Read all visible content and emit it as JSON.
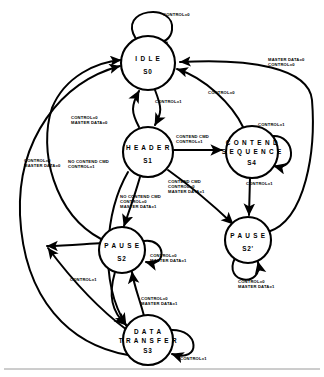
{
  "diagram": {
    "type": "state-machine",
    "title": "",
    "states": [
      {
        "id": "S0",
        "name": "IDLE",
        "label_line1": "I D L E",
        "label_line2": "S0",
        "cx": 148,
        "cy": 63,
        "r": 27
      },
      {
        "id": "S1",
        "name": "HEADER",
        "label_line1": "H E A D E R",
        "label_line2": "S1",
        "cx": 148,
        "cy": 152,
        "r": 25
      },
      {
        "id": "S4",
        "name": "CONTEND SEQUENCE",
        "label_line1": "C O N T E N D",
        "label_line2": "S4",
        "label_mid": "S E Q U E N C E",
        "cx": 252,
        "cy": 152,
        "r": 26
      },
      {
        "id": "S2",
        "name": "PAUSE",
        "label_line1": "P A U S E",
        "label_line2": "S2",
        "cx": 122,
        "cy": 250,
        "r": 23
      },
      {
        "id": "S2p",
        "name": "PAUSE PRIME",
        "label_line1": "P A U S E",
        "label_line2": "S2'",
        "cx": 248,
        "cy": 240,
        "r": 23
      },
      {
        "id": "S3",
        "name": "DATA TRANSFER",
        "label_line1": "D A T A",
        "label_line2": "S3",
        "label_mid": "T R A N S F E R",
        "cx": 148,
        "cy": 340,
        "r": 25
      }
    ],
    "transitions": [
      {
        "from": "S0",
        "to": "S0",
        "label": "CONTROL=0",
        "kind": "self"
      },
      {
        "from": "S0",
        "to": "S1",
        "label": "CONTROL=1",
        "kind": "arc"
      },
      {
        "from": "S1",
        "to": "S0",
        "label": "CONTROL=0\nMASTER DATA=0",
        "kind": "arc"
      },
      {
        "from": "S1",
        "to": "S4",
        "label": "CONTEND CMD\nCONTROL=1",
        "kind": "straight"
      },
      {
        "from": "S4",
        "to": "S4",
        "label": "CONTROL=1",
        "kind": "self"
      },
      {
        "from": "S4",
        "to": "S0",
        "label": "CONTROL=0",
        "kind": "arc"
      },
      {
        "from": "S4",
        "to": "S2p",
        "label": "CONTROL=1",
        "kind": "straight"
      },
      {
        "from": "S1",
        "to": "S2",
        "label": "NO CONTEND CMD\nCONTROL=1",
        "kind": "straight"
      },
      {
        "from": "S1",
        "to": "S2p",
        "label": "CONTEND CMD\nCONTROL=0\nMASTER DATA=1",
        "kind": "straight"
      },
      {
        "from": "S1",
        "to": "S2",
        "label": "NO CONTEND CMD\nCONTROL=0\nMASTER DATA=1",
        "kind": "straight"
      },
      {
        "from": "S2",
        "to": "S2",
        "label": "CONTROL=0\nMASTER DATA=1",
        "kind": "self"
      },
      {
        "from": "S2p",
        "to": "S2p",
        "label": "CONTROL=0\nMASTER DATA=1",
        "kind": "self"
      },
      {
        "from": "S2",
        "to": "S3",
        "label": "CONTROL=1",
        "kind": "arc"
      },
      {
        "from": "S3",
        "to": "S2",
        "label": "CONTROL=0\nMASTER DATA=1",
        "kind": "arc"
      },
      {
        "from": "S3",
        "to": "S3",
        "label": "CONTROL=1",
        "kind": "self"
      },
      {
        "from": "S3",
        "to": "S0",
        "label": "CONTROL=0\nMASTER DATA=0",
        "kind": "long-arc"
      },
      {
        "from": "S2",
        "to": "S0",
        "label": "CONTROL=0\nMASTER DATA=0",
        "kind": "long-arc"
      },
      {
        "from": "S2p",
        "to": "S0",
        "label": "MASTER DATA=0\nCONTROL=0",
        "kind": "long-arc"
      }
    ],
    "labels": [
      {
        "id": "l_idle_self",
        "text": "CONTROL=0",
        "x": 163,
        "y": 12
      },
      {
        "id": "l_md0_c0_right",
        "text": "MASTER DATA=0\nCONTROL=0",
        "x": 268,
        "y": 62
      },
      {
        "id": "l_c0_mid",
        "text": "CONTROL=0",
        "x": 217,
        "y": 92
      },
      {
        "id": "l_c1_idle_hdr",
        "text": "CONTROL=1",
        "x": 155,
        "y": 100
      },
      {
        "id": "l_c0_md0_hdr",
        "text": "CONTROL=0\nMASTER DATA=0",
        "x": 75,
        "y": 118
      },
      {
        "id": "l_contend_cmd",
        "text": "CONTEND CMD\nCONTROL=1",
        "x": 178,
        "y": 136
      },
      {
        "id": "l_c1_s4self",
        "text": "CONTROL=1",
        "x": 259,
        "y": 124
      },
      {
        "id": "l_c0_md0_left",
        "text": "CONTROL=0\nMASTER DATA=0",
        "x": 26,
        "y": 160
      },
      {
        "id": "l_nocontend_1",
        "text": "NO CONTEND CMD\nCONTROL=1",
        "x": 70,
        "y": 161
      },
      {
        "id": "l_contend_md1",
        "text": "CONTEND CMD\nCONTROL=0\nMASTER DATA=1",
        "x": 170,
        "y": 181
      },
      {
        "id": "l_c1_s4_s2p",
        "text": "CONTROL=1",
        "x": 249,
        "y": 182
      },
      {
        "id": "l_nocontend_0",
        "text": "NO CONTEND CMD\nCONTROL=0\nMASTER DATA=1",
        "x": 122,
        "y": 196
      },
      {
        "id": "l_s2_self",
        "text": "CONTROL=0\nMASTER DATA=1",
        "x": 150,
        "y": 255
      },
      {
        "id": "l_s2p_self",
        "text": "CONTROL=0\nMASTER DATA=1",
        "x": 240,
        "y": 280
      },
      {
        "id": "l_c1_s2_s3",
        "text": "CONTROL=1",
        "x": 72,
        "y": 278
      },
      {
        "id": "l_c0_md1_s3s2",
        "text": "CONTROL=0\nMASTER DATA=1",
        "x": 143,
        "y": 298
      },
      {
        "id": "l_s3_self",
        "text": "CONTROL=1",
        "x": 180,
        "y": 357
      }
    ],
    "colors": {
      "stroke": "#000000",
      "background": "#ffffff",
      "rule": "#9a9a9a"
    }
  }
}
